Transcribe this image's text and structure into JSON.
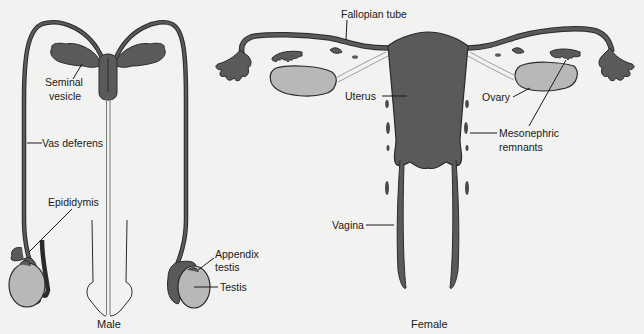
{
  "figure": {
    "male": {
      "caption": "Male",
      "labels": {
        "seminal_vesicle_line1": "Seminal",
        "seminal_vesicle_line2": "vesicle",
        "vas_deferens": "Vas deferens",
        "epididymis": "Epididymis",
        "appendix_testis_line1": "Appendix",
        "appendix_testis_line2": "testis",
        "testis": "Testis"
      }
    },
    "female": {
      "caption": "Female",
      "labels": {
        "fallopian_tube": "Fallopian tube",
        "uterus": "Uterus",
        "ovary": "Ovary",
        "mesonephric_line1": "Mesonephric",
        "mesonephric_line2": "remnants",
        "vagina": "Vagina"
      }
    }
  },
  "colors": {
    "background": "#f2f2f0",
    "dark_tissue": "#5a5a5a",
    "gonad": "#b8b8b8",
    "outline": "#2a2a2a",
    "text": "#1a1a1a"
  }
}
